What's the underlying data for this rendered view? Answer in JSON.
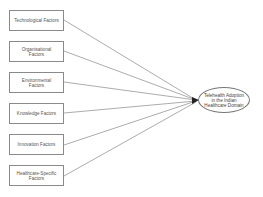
{
  "diagram": {
    "factors": [
      {
        "label": "Technological Factors",
        "top": 10
      },
      {
        "label": "Organisational Factors",
        "top": 41
      },
      {
        "label": "Environmental Factors",
        "top": 72
      },
      {
        "label": "Knowledge Factors",
        "top": 103
      },
      {
        "label": "Innovation Factors",
        "top": 134
      },
      {
        "label": "Healthcare-Specific Factors",
        "top": 165
      }
    ],
    "outcome": {
      "label": "Telehealth Adoption in the Indian Healthcare Domain"
    },
    "colors": {
      "border": "#8a8a8a",
      "line": "#888888",
      "arrow": "#222222"
    }
  }
}
